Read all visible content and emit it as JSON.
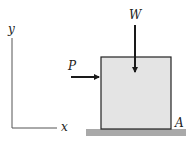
{
  "diagram": {
    "type": "free-body-diagram",
    "labels": {
      "y_axis": "y",
      "x_axis": "x",
      "force_horizontal": "P",
      "force_vertical": "W",
      "corner_point": "A"
    },
    "colors": {
      "block_fill": "#e4e4e4",
      "block_stroke": "#222222",
      "ground_fill": "#a9a9a9",
      "arrow": "#1a1a1a",
      "axis": "#555555"
    }
  }
}
